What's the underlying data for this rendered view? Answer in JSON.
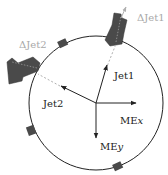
{
  "diagram": {
    "labels": {
      "jet1": "Jet1",
      "jet2": "Jet2",
      "mex_prefix": "ME",
      "mex_suffix": "x",
      "mey_prefix": "ME",
      "mey_suffix": "y",
      "delta_jet1": "ΔJet1",
      "delta_jet2": "ΔJet2"
    },
    "colors": {
      "circle": "#222222",
      "arrows": "#222222",
      "calorimeter_blocks": "#4a4a4a",
      "dashed_lines": "#b0b0b0",
      "delta_labels": "#a8a8a8"
    }
  }
}
